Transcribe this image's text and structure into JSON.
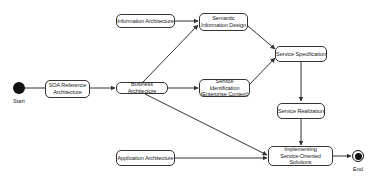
{
  "diagram": {
    "type": "activity-diagram",
    "start": {
      "label": "Start"
    },
    "end": {
      "label": "End"
    },
    "nodes": [
      {
        "id": "soa",
        "label": "SOA Reference\nArchitecture"
      },
      {
        "id": "business",
        "label": "Business Architecture"
      },
      {
        "id": "information",
        "label": "Information Architecture"
      },
      {
        "id": "semantic",
        "label": "Semantic\nInformation Design"
      },
      {
        "id": "identification",
        "label": "Service Identification\n(Enterprise Context)"
      },
      {
        "id": "specification",
        "label": "Service Specification"
      },
      {
        "id": "realization",
        "label": "Service Realization"
      },
      {
        "id": "application",
        "label": "Application Architecture"
      },
      {
        "id": "implementing",
        "label": "Implementing\nService-Oriented Solutions"
      }
    ],
    "edges": [
      {
        "from": "start",
        "to": "soa"
      },
      {
        "from": "soa",
        "to": "business"
      },
      {
        "from": "business",
        "to": "semantic"
      },
      {
        "from": "information",
        "to": "semantic"
      },
      {
        "from": "business",
        "to": "identification"
      },
      {
        "from": "business",
        "to": "implementing"
      },
      {
        "from": "semantic",
        "to": "specification"
      },
      {
        "from": "identification",
        "to": "specification"
      },
      {
        "from": "specification",
        "to": "realization"
      },
      {
        "from": "realization",
        "to": "implementing"
      },
      {
        "from": "application",
        "to": "implementing"
      },
      {
        "from": "implementing",
        "to": "end"
      }
    ],
    "colors": {
      "line": "#333333",
      "node_border": "#333333",
      "node_fill": "#ffffff",
      "pseudo_fill": "#111111"
    }
  }
}
